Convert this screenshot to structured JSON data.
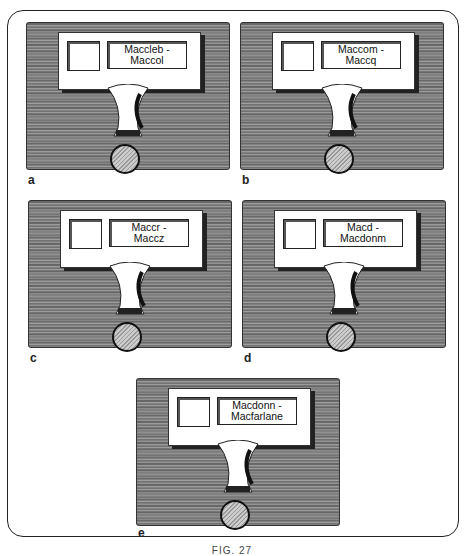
{
  "figure": {
    "caption": "FIG. 27",
    "panels": [
      {
        "letter": "a",
        "label_line1": "Maccleb -",
        "label_line2": "Maccol"
      },
      {
        "letter": "b",
        "label_line1": "Maccom -",
        "label_line2": "Maccq"
      },
      {
        "letter": "c",
        "label_line1": "Maccr -",
        "label_line2": "Maccz"
      },
      {
        "letter": "d",
        "label_line1": "Macd -",
        "label_line2": "Macdonm"
      },
      {
        "letter": "e",
        "label_line1": "Macdonn -",
        "label_line2": "Macfarlane"
      }
    ]
  }
}
